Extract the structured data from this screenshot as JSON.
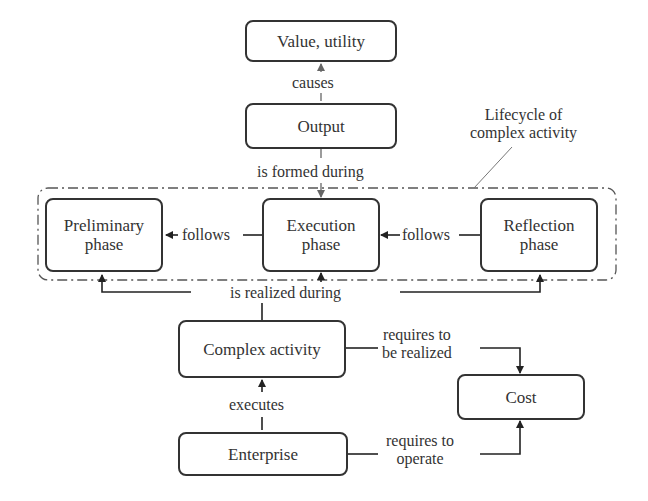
{
  "diagram": {
    "nodes": {
      "value_utility": "Value, utility",
      "output": "Output",
      "preliminary_phase": "Preliminary\nphase",
      "execution_phase": "Execution\nphase",
      "reflection_phase": "Reflection\nphase",
      "complex_activity": "Complex activity",
      "cost": "Cost",
      "enterprise": "Enterprise"
    },
    "group": {
      "label": "Lifecycle of\ncomplex activity",
      "members": [
        "preliminary_phase",
        "execution_phase",
        "reflection_phase"
      ]
    },
    "edges": [
      {
        "from": "output",
        "to": "value_utility",
        "label": "causes"
      },
      {
        "from": "output",
        "to": "execution_phase",
        "label": "is formed during"
      },
      {
        "from": "execution_phase",
        "to": "preliminary_phase",
        "label": "follows"
      },
      {
        "from": "reflection_phase",
        "to": "execution_phase",
        "label": "follows"
      },
      {
        "from": "complex_activity",
        "to": [
          "preliminary_phase",
          "execution_phase",
          "reflection_phase"
        ],
        "label": "is realized during"
      },
      {
        "from": "complex_activity",
        "to": "cost",
        "label": "requires to\nbe realized"
      },
      {
        "from": "enterprise",
        "to": "complex_activity",
        "label": "executes"
      },
      {
        "from": "enterprise",
        "to": "cost",
        "label": "requires to\noperate"
      }
    ]
  },
  "labels": {
    "causes": "causes",
    "is_formed_during": "is formed during",
    "follows_left": "follows",
    "follows_right": "follows",
    "is_realized_during": "is realized during",
    "requires_to_be_realized": "requires to\nbe realized",
    "executes": "executes",
    "requires_to_operate": "requires to\noperate",
    "lifecycle": "Lifecycle of\ncomplex activity"
  }
}
